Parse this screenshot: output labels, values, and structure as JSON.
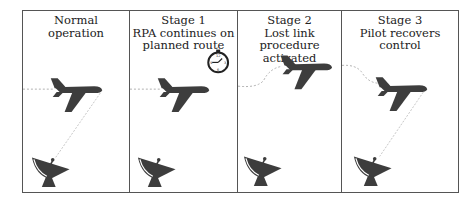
{
  "diagram": {
    "type": "lost-link-stages",
    "colors": {
      "icon": "#3d3d3d",
      "border": "#555555",
      "link_line": "#b0b0b0",
      "text": "#222222"
    },
    "panels": [
      {
        "id": "normal",
        "title_lines": [
          "Normal",
          "operation"
        ],
        "aircraft_icon": "aircraft-icon",
        "ground_station_icon": "satellite-dish-icon",
        "data_link": true,
        "flight_path": "straight",
        "extra_icon": null
      },
      {
        "id": "stage1",
        "title_lines": [
          "Stage 1",
          "RPA continues on",
          "planned route"
        ],
        "aircraft_icon": "aircraft-icon",
        "ground_station_icon": "satellite-dish-icon",
        "data_link": false,
        "flight_path": "straight",
        "extra_icon": "stopwatch-icon",
        "stopwatch_marks": [
          "12",
          "3",
          "6",
          "9"
        ]
      },
      {
        "id": "stage2",
        "title_lines": [
          "Stage 2",
          "Lost link procedure",
          "activated"
        ],
        "aircraft_icon": "aircraft-icon",
        "ground_station_icon": "satellite-dish-icon",
        "data_link": false,
        "flight_path": "climbing-curve",
        "extra_icon": null
      },
      {
        "id": "stage3",
        "title_lines": [
          "Stage 3",
          "Pilot recovers control"
        ],
        "aircraft_icon": "aircraft-icon",
        "ground_station_icon": "satellite-dish-icon",
        "data_link": true,
        "flight_path": "descending-curve",
        "extra_icon": null
      }
    ]
  }
}
